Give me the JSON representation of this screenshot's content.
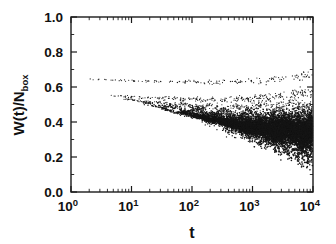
{
  "figure": {
    "title": "",
    "background_color": "#ffffff",
    "marker_color": "#151515",
    "axis_color": "#1a1a1a"
  },
  "axes": {
    "y": {
      "label_main": "W(t)/N",
      "label_sub": "box",
      "label_full": "W(t)/Nbox",
      "min": 0.0,
      "max": 1.0,
      "scale": "linear",
      "ticks": [
        "0.0",
        "0.2",
        "0.4",
        "0.6",
        "0.8",
        "1.0"
      ],
      "tick_values": [
        0.0,
        0.2,
        0.4,
        0.6,
        0.8,
        1.0
      ],
      "minor_ticks_per_interval": 1
    },
    "x": {
      "label": "t",
      "min": 1,
      "max": 10000,
      "scale": "log",
      "ticks": [
        "10",
        "10",
        "10",
        "10",
        "10"
      ],
      "tick_exponents": [
        "0",
        "1",
        "2",
        "3",
        "4"
      ],
      "tick_values": [
        1,
        10,
        100,
        1000,
        10000
      ]
    }
  },
  "chart_data": {
    "type": "scatter",
    "title": "",
    "xlabel": "t",
    "ylabel": "W(t)/Nbox",
    "xscale": "log",
    "yscale": "linear",
    "xlim": [
      1,
      10000
    ],
    "ylim": [
      0.0,
      1.0
    ],
    "grid": false,
    "legend": "none",
    "marker": "point",
    "marker_size_px": 1.2,
    "series": [
      {
        "name": "branch-1-upper",
        "t_start": 2,
        "t_end": 10000,
        "y_start": 0.645,
        "y_mid": 0.628,
        "y_end": 0.668,
        "scatter": 0.012,
        "density": 150
      },
      {
        "name": "branch-2",
        "t_start": 4,
        "t_end": 10000,
        "y_start": 0.552,
        "y_mid": 0.528,
        "y_end": 0.575,
        "scatter": 0.016,
        "density": 260
      },
      {
        "name": "branch-3",
        "t_start": 7,
        "t_end": 10000,
        "y_start": 0.535,
        "y_mid": 0.492,
        "y_end": 0.515,
        "scatter": 0.02,
        "density": 420
      },
      {
        "name": "branch-4",
        "t_start": 15,
        "t_end": 10000,
        "y_start": 0.51,
        "y_mid": 0.455,
        "y_end": 0.47,
        "scatter": 0.026,
        "density": 700
      },
      {
        "name": "branch-5",
        "t_start": 30,
        "t_end": 10000,
        "y_start": 0.48,
        "y_mid": 0.428,
        "y_end": 0.44,
        "scatter": 0.03,
        "density": 1100
      },
      {
        "name": "branch-6",
        "t_start": 60,
        "t_end": 10000,
        "y_start": 0.462,
        "y_mid": 0.405,
        "y_end": 0.412,
        "scatter": 0.034,
        "density": 1700
      },
      {
        "name": "branch-7-dense",
        "t_start": 110,
        "t_end": 10000,
        "y_start": 0.445,
        "y_mid": 0.385,
        "y_end": 0.378,
        "scatter": 0.04,
        "density": 2600
      },
      {
        "name": "branch-8-dense",
        "t_start": 220,
        "t_end": 10000,
        "y_start": 0.43,
        "y_mid": 0.368,
        "y_end": 0.355,
        "scatter": 0.044,
        "density": 3400
      }
    ]
  }
}
